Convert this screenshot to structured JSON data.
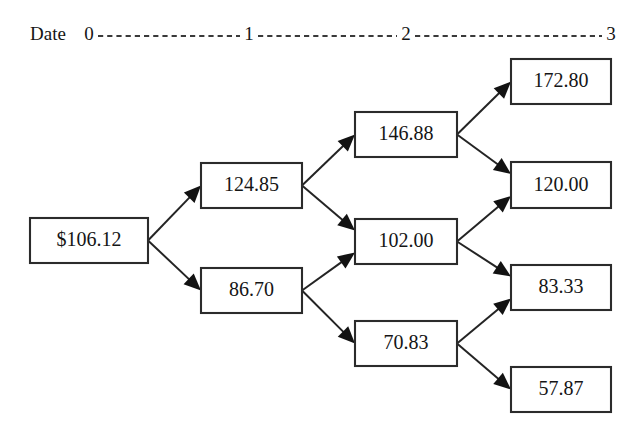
{
  "axis": {
    "label": "Date",
    "label_x": 30,
    "label_y": 36,
    "line_y": 36,
    "ticks": [
      {
        "label": "0",
        "x": 89
      },
      {
        "label": "1",
        "x": 249
      },
      {
        "label": "2",
        "x": 406
      },
      {
        "label": "3",
        "x": 611
      }
    ]
  },
  "chart_data": {
    "type": "diagram",
    "subtype": "binomial-lattice",
    "title": "",
    "xlabel": "Date",
    "x_tick_labels": [
      "0",
      "1",
      "2",
      "3"
    ],
    "recombining": true,
    "levels": [
      {
        "date": 0,
        "values": [
          "$106.12"
        ]
      },
      {
        "date": 1,
        "values": [
          "124.85",
          "86.70"
        ]
      },
      {
        "date": 2,
        "values": [
          "146.88",
          "102.00",
          "70.83"
        ]
      },
      {
        "date": 3,
        "values": [
          "172.80",
          "120.00",
          "83.33",
          "57.87"
        ]
      }
    ],
    "edges": [
      {
        "from": "n0",
        "to": "n1u",
        "direction": "up"
      },
      {
        "from": "n0",
        "to": "n1d",
        "direction": "down"
      },
      {
        "from": "n1u",
        "to": "n2uu",
        "direction": "up"
      },
      {
        "from": "n1u",
        "to": "n2ud",
        "direction": "down"
      },
      {
        "from": "n1d",
        "to": "n2ud",
        "direction": "up"
      },
      {
        "from": "n1d",
        "to": "n2dd",
        "direction": "down"
      },
      {
        "from": "n2uu",
        "to": "n3uuu",
        "direction": "up"
      },
      {
        "from": "n2uu",
        "to": "n3uud",
        "direction": "down"
      },
      {
        "from": "n2ud",
        "to": "n3uud",
        "direction": "up"
      },
      {
        "from": "n2ud",
        "to": "n3udd",
        "direction": "down"
      },
      {
        "from": "n2dd",
        "to": "n3udd",
        "direction": "up"
      },
      {
        "from": "n2dd",
        "to": "n3ddd",
        "direction": "down"
      }
    ]
  },
  "nodes": {
    "n0": {
      "value": "$106.12",
      "x": 30,
      "y": 218,
      "w": 118,
      "h": 45
    },
    "n1u": {
      "value": "124.85",
      "x": 201,
      "y": 163,
      "w": 101,
      "h": 45
    },
    "n1d": {
      "value": "86.70",
      "x": 201,
      "y": 268,
      "w": 101,
      "h": 45
    },
    "n2uu": {
      "value": "146.88",
      "x": 355,
      "y": 112,
      "w": 102,
      "h": 45
    },
    "n2ud": {
      "value": "102.00",
      "x": 355,
      "y": 219,
      "w": 102,
      "h": 45
    },
    "n2dd": {
      "value": "70.83",
      "x": 355,
      "y": 321,
      "w": 102,
      "h": 45
    },
    "n3uuu": {
      "value": "172.80",
      "x": 511,
      "y": 59,
      "w": 100,
      "h": 45
    },
    "n3uud": {
      "value": "120.00",
      "x": 511,
      "y": 162,
      "w": 100,
      "h": 46
    },
    "n3udd": {
      "value": "83.33",
      "x": 511,
      "y": 265,
      "w": 100,
      "h": 45
    },
    "n3ddd": {
      "value": "57.87",
      "x": 511,
      "y": 367,
      "w": 100,
      "h": 45
    }
  },
  "colors": {
    "box_stroke": "#2b2b2b",
    "text": "#151515",
    "edge": "#242424",
    "background": "#ffffff"
  }
}
